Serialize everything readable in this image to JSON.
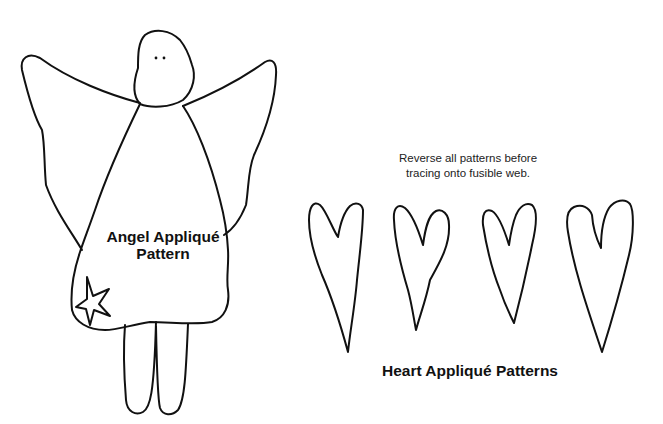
{
  "angel": {
    "label_line1": "Angel Appliqué",
    "label_line2": "Pattern"
  },
  "instructions": {
    "line1": "Reverse all patterns before",
    "line2": "tracing onto fusible web."
  },
  "hearts": {
    "label": "Heart Appliqué Patterns",
    "count": 4
  },
  "colors": {
    "stroke": "#111111",
    "background": "#ffffff"
  }
}
